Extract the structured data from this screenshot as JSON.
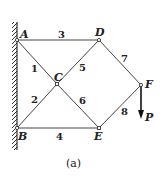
{
  "figure": {
    "caption": "(a)",
    "nodes": [
      {
        "id": "A",
        "label": "A"
      },
      {
        "id": "B",
        "label": "B"
      },
      {
        "id": "C",
        "label": "C"
      },
      {
        "id": "D",
        "label": "D"
      },
      {
        "id": "E",
        "label": "E"
      },
      {
        "id": "F",
        "label": "F"
      }
    ],
    "members": [
      {
        "id": "1",
        "label": "1",
        "from": "A",
        "to": "C"
      },
      {
        "id": "2",
        "label": "2",
        "from": "B",
        "to": "C"
      },
      {
        "id": "3",
        "label": "3",
        "from": "A",
        "to": "D"
      },
      {
        "id": "4",
        "label": "4",
        "from": "B",
        "to": "E"
      },
      {
        "id": "5",
        "label": "5",
        "from": "C",
        "to": "D"
      },
      {
        "id": "6",
        "label": "6",
        "from": "C",
        "to": "E"
      },
      {
        "id": "7",
        "label": "7",
        "from": "D",
        "to": "F"
      },
      {
        "id": "8",
        "label": "8",
        "from": "E",
        "to": "F"
      }
    ],
    "load": {
      "label": "P",
      "at": "F",
      "direction": "down"
    },
    "support": "fixed wall at A and B"
  }
}
